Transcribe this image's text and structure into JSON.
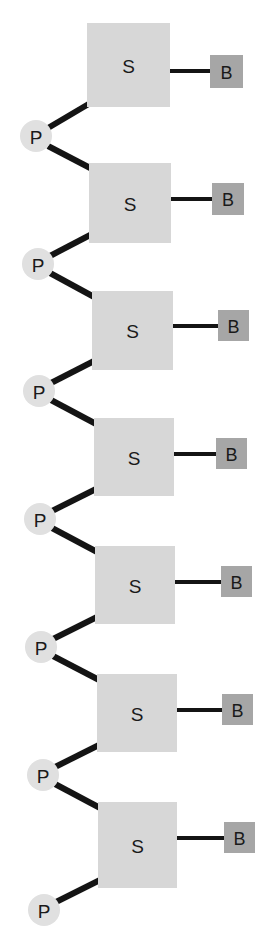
{
  "diagram": {
    "canvas": {
      "width": 271,
      "height": 947,
      "background": "#ffffff"
    },
    "colors": {
      "sugar_fill": "#d7d7d7",
      "base_fill": "#a6a6a6",
      "phosphate_fill": "#e0e0e0",
      "bond_stroke": "#141414",
      "label_text": "#1a1a1a",
      "background": "#ffffff"
    },
    "labels": {
      "sugar": "S",
      "base": "B",
      "phosphate": "P"
    },
    "legend_note": "S = sugar, P = phosphate, B = nitrogenous base",
    "counts": {
      "sugars": 7,
      "bases": 7,
      "phosphates": 7
    },
    "geometry": {
      "sugar_size": 80,
      "base_size": 31,
      "phosphate_radius": 16,
      "bond_width": 6,
      "base_bond_width": 4
    },
    "sugars": [
      {
        "label": "S",
        "x": 87,
        "y": 23,
        "w": 83,
        "h": 84
      },
      {
        "label": "S",
        "x": 89,
        "y": 163,
        "w": 82,
        "h": 80
      },
      {
        "label": "S",
        "x": 92,
        "y": 291,
        "w": 81,
        "h": 79
      },
      {
        "label": "S",
        "x": 94,
        "y": 418,
        "w": 80,
        "h": 78
      },
      {
        "label": "S",
        "x": 95,
        "y": 546,
        "w": 80,
        "h": 78
      },
      {
        "label": "S",
        "x": 97,
        "y": 674,
        "w": 80,
        "h": 78
      },
      {
        "label": "S",
        "x": 98,
        "y": 802,
        "w": 79,
        "h": 86
      }
    ],
    "bases": [
      {
        "label": "B",
        "x": 210,
        "y": 55,
        "w": 33,
        "h": 33
      },
      {
        "label": "B",
        "x": 212,
        "y": 183,
        "w": 32,
        "h": 32
      },
      {
        "label": "B",
        "x": 218,
        "y": 310,
        "w": 31,
        "h": 31
      },
      {
        "label": "B",
        "x": 216,
        "y": 438,
        "w": 31,
        "h": 31
      },
      {
        "label": "B",
        "x": 221,
        "y": 566,
        "w": 31,
        "h": 31
      },
      {
        "label": "B",
        "x": 222,
        "y": 694,
        "w": 31,
        "h": 31
      },
      {
        "label": "B",
        "x": 224,
        "y": 822,
        "w": 31,
        "h": 31
      }
    ],
    "phosphates": [
      {
        "label": "P",
        "cx": 36,
        "cy": 136,
        "r": 16
      },
      {
        "label": "P",
        "cx": 38,
        "cy": 264,
        "r": 16
      },
      {
        "label": "P",
        "cx": 39,
        "cy": 391,
        "r": 16
      },
      {
        "label": "P",
        "cx": 40,
        "cy": 519,
        "r": 16
      },
      {
        "label": "P",
        "cx": 41,
        "cy": 647,
        "r": 16
      },
      {
        "label": "P",
        "cx": 43,
        "cy": 775,
        "r": 16
      },
      {
        "label": "P",
        "cx": 44,
        "cy": 910,
        "r": 16
      }
    ],
    "base_bonds": [
      {
        "x1": 168,
        "y1": 71,
        "x2": 212,
        "y2": 71
      },
      {
        "x1": 169,
        "y1": 199,
        "x2": 214,
        "y2": 199
      },
      {
        "x1": 171,
        "y1": 326,
        "x2": 220,
        "y2": 326
      },
      {
        "x1": 172,
        "y1": 454,
        "x2": 218,
        "y2": 454
      },
      {
        "x1": 173,
        "y1": 582,
        "x2": 223,
        "y2": 582
      },
      {
        "x1": 175,
        "y1": 710,
        "x2": 224,
        "y2": 710
      },
      {
        "x1": 175,
        "y1": 838,
        "x2": 226,
        "y2": 838
      }
    ],
    "backbone_bonds": [
      {
        "x1": 48,
        "y1": 128,
        "x2": 92,
        "y2": 102,
        "from": "P1",
        "to": "S1"
      },
      {
        "x1": 48,
        "y1": 146,
        "x2": 94,
        "y2": 170,
        "from": "P1",
        "to": "S2"
      },
      {
        "x1": 50,
        "y1": 256,
        "x2": 94,
        "y2": 233,
        "from": "P2",
        "to": "S2"
      },
      {
        "x1": 50,
        "y1": 273,
        "x2": 96,
        "y2": 298,
        "from": "P2",
        "to": "S3"
      },
      {
        "x1": 51,
        "y1": 383,
        "x2": 96,
        "y2": 360,
        "from": "P3",
        "to": "S3"
      },
      {
        "x1": 51,
        "y1": 400,
        "x2": 98,
        "y2": 425,
        "from": "P3",
        "to": "S4"
      },
      {
        "x1": 52,
        "y1": 511,
        "x2": 98,
        "y2": 488,
        "from": "P4",
        "to": "S4"
      },
      {
        "x1": 52,
        "y1": 528,
        "x2": 99,
        "y2": 553,
        "from": "P4",
        "to": "S5"
      },
      {
        "x1": 53,
        "y1": 639,
        "x2": 99,
        "y2": 616,
        "from": "P5",
        "to": "S5"
      },
      {
        "x1": 53,
        "y1": 656,
        "x2": 101,
        "y2": 681,
        "from": "P5",
        "to": "S6"
      },
      {
        "x1": 55,
        "y1": 767,
        "x2": 101,
        "y2": 744,
        "from": "P6",
        "to": "S6"
      },
      {
        "x1": 55,
        "y1": 784,
        "x2": 102,
        "y2": 809,
        "from": "P6",
        "to": "S7"
      },
      {
        "x1": 56,
        "y1": 902,
        "x2": 102,
        "y2": 879,
        "from": "P7",
        "to": "S7"
      }
    ]
  }
}
